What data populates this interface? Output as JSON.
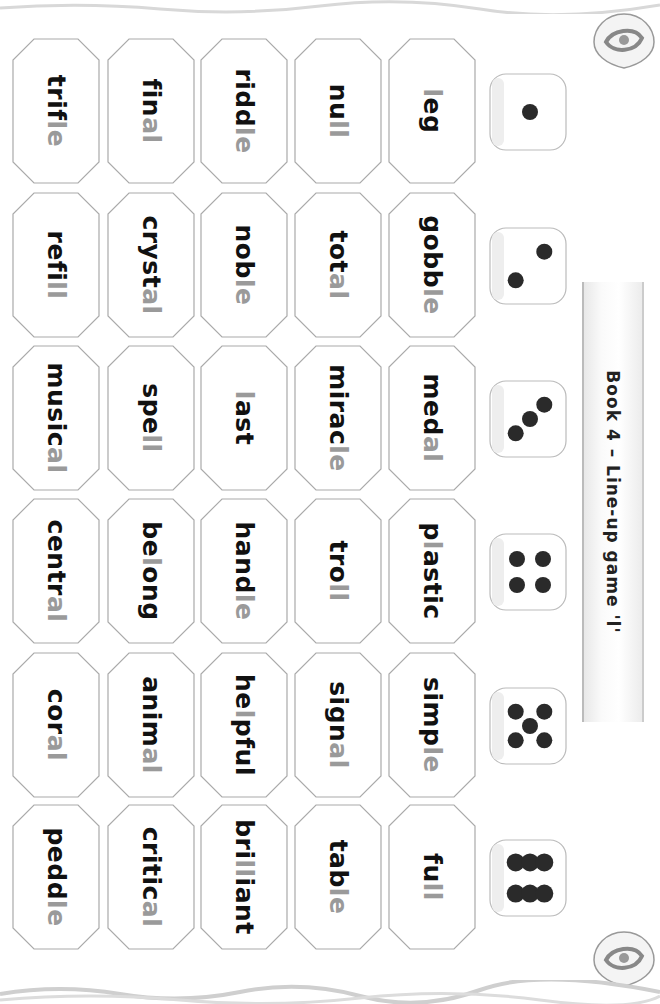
{
  "title": "Book 4 – Line-up game 'l'",
  "highlight_color": "#9a9a9a",
  "text_color": "#111111",
  "dice": [
    1,
    2,
    3,
    4,
    5,
    6
  ],
  "columns": [
    {
      "die": 1,
      "words": [
        {
          "pre": "",
          "hl": "l",
          "post": "eg"
        },
        {
          "pre": "nu",
          "hl": "ll",
          "post": ""
        },
        {
          "pre": "ridd",
          "hl": "le",
          "post": ""
        },
        {
          "pre": "fin",
          "hl": "al",
          "post": ""
        },
        {
          "pre": "trif",
          "hl": "le",
          "post": ""
        }
      ]
    },
    {
      "die": 2,
      "words": [
        {
          "pre": "gobb",
          "hl": "le",
          "post": ""
        },
        {
          "pre": "tot",
          "hl": "al",
          "post": ""
        },
        {
          "pre": "nob",
          "hl": "le",
          "post": ""
        },
        {
          "pre": "cryst",
          "hl": "al",
          "post": ""
        },
        {
          "pre": "refi",
          "hl": "ll",
          "post": ""
        }
      ]
    },
    {
      "die": 3,
      "words": [
        {
          "pre": "med",
          "hl": "al",
          "post": ""
        },
        {
          "pre": "mirac",
          "hl": "le",
          "post": ""
        },
        {
          "pre": "",
          "hl": "l",
          "post": "ast"
        },
        {
          "pre": "spe",
          "hl": "ll",
          "post": ""
        },
        {
          "pre": "music",
          "hl": "al",
          "post": ""
        }
      ]
    },
    {
      "die": 4,
      "words": [
        {
          "pre": "p",
          "hl": "l",
          "post": "astic"
        },
        {
          "pre": "tro",
          "hl": "ll",
          "post": ""
        },
        {
          "pre": "hand",
          "hl": "le",
          "post": ""
        },
        {
          "pre": "be",
          "hl": "l",
          "post": "ong"
        },
        {
          "pre": "centr",
          "hl": "al",
          "post": ""
        }
      ]
    },
    {
      "die": 5,
      "words": [
        {
          "pre": "simp",
          "hl": "le",
          "post": ""
        },
        {
          "pre": "sign",
          "hl": "al",
          "post": ""
        },
        {
          "pre": "he",
          "hl": "l",
          "post": "pful"
        },
        {
          "pre": "anim",
          "hl": "al",
          "post": ""
        },
        {
          "pre": "cor",
          "hl": "al",
          "post": ""
        }
      ]
    },
    {
      "die": 6,
      "words": [
        {
          "pre": "fu",
          "hl": "ll",
          "post": ""
        },
        {
          "pre": "tab",
          "hl": "le",
          "post": ""
        },
        {
          "pre": "bri",
          "hl": "ll",
          "post": "iant"
        },
        {
          "pre": "critic",
          "hl": "al",
          "post": ""
        },
        {
          "pre": "pedd",
          "hl": "le",
          "post": ""
        }
      ]
    }
  ]
}
